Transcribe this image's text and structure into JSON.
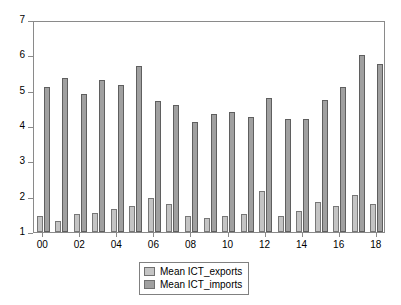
{
  "chart_data": {
    "type": "bar",
    "title": "",
    "subtitle": "",
    "xlabel": "",
    "ylabel": "",
    "categories": [
      "00",
      "01",
      "02",
      "03",
      "04",
      "05",
      "06",
      "07",
      "08",
      "09",
      "10",
      "11",
      "12",
      "13",
      "14",
      "15",
      "16",
      "17",
      "18"
    ],
    "tick_labels_x": [
      "00",
      "02",
      "04",
      "06",
      "08",
      "10",
      "12",
      "14",
      "16",
      "18"
    ],
    "tick_labels_y": [
      "1",
      "2",
      "3",
      "4",
      "5",
      "6",
      "7"
    ],
    "ylim": [
      1,
      7
    ],
    "grid": false,
    "legend_position": "bottom-center",
    "series": [
      {
        "name": "Mean ICT_exports",
        "color": "#c4c4c4",
        "values": [
          1.45,
          1.3,
          1.5,
          1.55,
          1.65,
          1.75,
          1.95,
          1.8,
          1.45,
          1.4,
          1.45,
          1.5,
          2.15,
          1.45,
          1.6,
          1.85,
          1.75,
          2.05,
          1.8
        ]
      },
      {
        "name": "Mean ICT_imports",
        "color": "#a0a0a0",
        "values": [
          5.1,
          5.35,
          4.9,
          5.3,
          5.15,
          5.7,
          4.7,
          4.6,
          4.1,
          4.35,
          4.4,
          4.25,
          4.8,
          4.2,
          4.2,
          4.75,
          5.1,
          6.0,
          5.75
        ]
      }
    ]
  },
  "legend": {
    "items": [
      {
        "label": "Mean ICT_exports",
        "swatch": "exports"
      },
      {
        "label": "Mean ICT_imports",
        "swatch": "imports"
      }
    ]
  },
  "colors": {
    "exports_fill": "#c4c4c4",
    "imports_fill": "#a0a0a0",
    "axis": "#8a8a8a",
    "background": "#ffffff",
    "text": "#000000"
  }
}
